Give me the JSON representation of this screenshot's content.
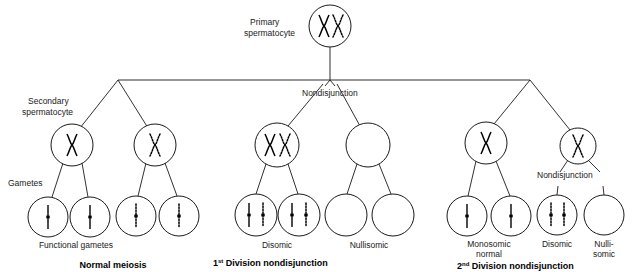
{
  "diagram": {
    "stroke_color": "#1a1a1a",
    "chromosome_solid_color": "#000000",
    "chromosome_dotted_color": "#000000"
  },
  "labels": {
    "primary_spermatocyte_line1": "Primary",
    "primary_spermatocyte_line2": "spermatocyte",
    "secondary_spermatocyte_line1": "Secondary",
    "secondary_spermatocyte_line2": "spermatocyte",
    "gametes": "Gametes",
    "functional_gametes": "Functional gametes",
    "nondisjunction_top": "Nondisjunction",
    "nondisjunction_second": "Nondisjunction",
    "disomic_1": "Disomic",
    "nullisomic_1": "Nullisomic",
    "monosomic_line1": "Monosomic",
    "monosomic_line2": "normal",
    "disomic_2": "Disomic",
    "nullisomic_line1": "Nulli-",
    "nullisomic_line2": "somic"
  },
  "section_titles": {
    "normal_meiosis": "Normal meiosis",
    "first_division_num": "1",
    "first_division_sup": "st",
    "first_division_rest": " Division nondisjunction",
    "second_division_num": "2",
    "second_division_sup": "nd",
    "second_division_rest": " Division nondisjunction"
  },
  "cells": {
    "primary": {
      "name": "primary-spermatocyte",
      "cx": 330,
      "cy": 26,
      "r": 21,
      "contents": "two-chromosomes-solid-and-dotted"
    },
    "secondary": [
      {
        "name": "secondary-spermatocyte-normal-solid",
        "cx": 72,
        "cy": 145,
        "r": 21,
        "contents": "one-solid-x-chromosome"
      },
      {
        "name": "secondary-spermatocyte-normal-dotted",
        "cx": 155,
        "cy": 145,
        "r": 21,
        "contents": "one-dotted-x-chromosome"
      },
      {
        "name": "secondary-spermatocyte-disomic",
        "cx": 277,
        "cy": 145,
        "r": 22,
        "contents": "two-chromosomes-solid-and-dotted"
      },
      {
        "name": "secondary-spermatocyte-nullisomic",
        "cx": 368,
        "cy": 145,
        "r": 22,
        "contents": "empty"
      },
      {
        "name": "secondary-spermatocyte-normal-2nd",
        "cx": 486,
        "cy": 143,
        "r": 21,
        "contents": "one-solid-x-chromosome"
      },
      {
        "name": "secondary-spermatocyte-nondisjunction-2nd",
        "cx": 578,
        "cy": 146,
        "r": 18,
        "contents": "one-dotted-x-chromosome"
      }
    ],
    "gametes": [
      {
        "name": "gamete-normal-solid-1",
        "cx": 48,
        "cy": 217,
        "r": 20,
        "contents": "solid-chromatid"
      },
      {
        "name": "gamete-normal-solid-2",
        "cx": 90,
        "cy": 217,
        "r": 20,
        "contents": "solid-chromatid"
      },
      {
        "name": "gamete-normal-dotted-1",
        "cx": 136,
        "cy": 216,
        "r": 20,
        "contents": "dotted-chromatid"
      },
      {
        "name": "gamete-normal-dotted-2",
        "cx": 179,
        "cy": 216,
        "r": 20,
        "contents": "dotted-chromatid"
      },
      {
        "name": "gamete-disomic-1",
        "cx": 256,
        "cy": 215,
        "r": 21,
        "contents": "solid-and-dotted-chromatid"
      },
      {
        "name": "gamete-disomic-2",
        "cx": 299,
        "cy": 215,
        "r": 21,
        "contents": "solid-and-dotted-chromatid"
      },
      {
        "name": "gamete-nullisomic-1",
        "cx": 346,
        "cy": 215,
        "r": 21,
        "contents": "empty"
      },
      {
        "name": "gamete-nullisomic-2",
        "cx": 393,
        "cy": 215,
        "r": 21,
        "contents": "empty"
      },
      {
        "name": "gamete-monosomic-normal-1",
        "cx": 467,
        "cy": 216,
        "r": 20,
        "contents": "solid-chromatid"
      },
      {
        "name": "gamete-monosomic-normal-2",
        "cx": 511,
        "cy": 216,
        "r": 20,
        "contents": "solid-chromatid"
      },
      {
        "name": "gamete-disomic-2nd",
        "cx": 557,
        "cy": 215,
        "r": 20,
        "contents": "two-dotted-chromatids"
      },
      {
        "name": "gamete-nullisomic-2nd",
        "cx": 604,
        "cy": 215,
        "r": 20,
        "contents": "empty"
      }
    ]
  }
}
